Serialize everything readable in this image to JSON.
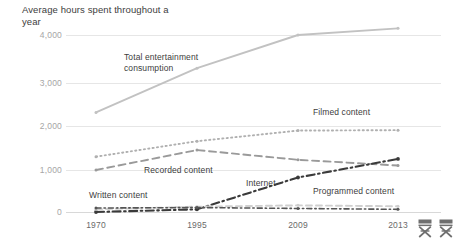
{
  "chart_data": {
    "type": "line",
    "title": "Average hours spent throughout a year",
    "xlabel": "",
    "ylabel": "Average hours spent throughout a year",
    "x": [
      1970,
      1995,
      2009,
      2013
    ],
    "xtick_labels": [
      "1970",
      "1995",
      "2009",
      "2013"
    ],
    "ytick_labels": [
      "4,000",
      "3,000",
      "2,000",
      "1,000",
      "0"
    ],
    "ytick_values": [
      4000,
      3000,
      2000,
      1000,
      0
    ],
    "ylim": [
      0,
      4400
    ],
    "grid": true,
    "legend_position": "inline-annotations",
    "series": [
      {
        "name": "Total entertainment consumption",
        "style": "solid",
        "color": "#c2c2c2",
        "values": [
          2250,
          3250,
          4000,
          4150
        ]
      },
      {
        "name": "Filmed content",
        "style": "dotted",
        "color": "#b0b0b0",
        "values": [
          1250,
          1600,
          1840,
          1850
        ]
      },
      {
        "name": "Recorded content",
        "style": "dashed",
        "color": "#9a9a9a",
        "values": [
          950,
          1400,
          1180,
          1050
        ]
      },
      {
        "name": "Internet",
        "style": "dash-dot",
        "color": "#3a3a3a",
        "values": [
          0,
          60,
          780,
          1200
        ]
      },
      {
        "name": "Programmed content",
        "style": "dashed-light",
        "color": "#cfcfcf",
        "values": [
          60,
          120,
          150,
          130
        ]
      },
      {
        "name": "Written content",
        "style": "dash-dot-dark",
        "color": "#555555",
        "values": [
          90,
          100,
          80,
          60
        ]
      }
    ],
    "annotations": [
      {
        "text": "Total entertainment\nconsumption",
        "x": 124,
        "y": 52
      },
      {
        "text": "Filmed content",
        "x": 313,
        "y": 107
      },
      {
        "text": "Recorded content",
        "x": 144,
        "y": 165
      },
      {
        "text": "Internet",
        "x": 246,
        "y": 178
      },
      {
        "text": "Programmed content",
        "x": 313,
        "y": 186
      },
      {
        "text": "Written content",
        "x": 89,
        "y": 190
      }
    ]
  },
  "icons": {
    "chair_one": "directors-chair-icon",
    "chair_two": "directors-chair-icon"
  }
}
